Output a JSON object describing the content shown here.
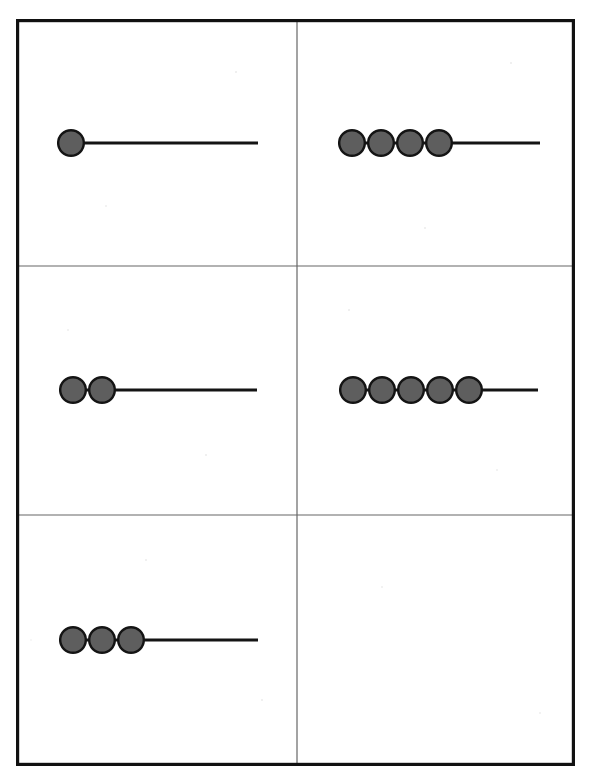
{
  "figure": {
    "background_color": "#ffffff",
    "canvas": {
      "width": 591,
      "height": 781
    }
  },
  "frame": {
    "border_color": "#111111",
    "border_width": 3,
    "divider_color": "#666666",
    "divider_width": 1,
    "x": 16,
    "y": 19,
    "width": 559,
    "height": 747,
    "columns": 2,
    "rows": 3,
    "column_divider_x": [
      281
    ],
    "row_divider_y": [
      247,
      496
    ]
  },
  "style": {
    "circle_fill": "#5e5e5e",
    "circle_stroke": "#141414",
    "circle_stroke_width": 2.4,
    "circle_diameter": 28,
    "circle_pitch": 29,
    "line_color": "#141414",
    "line_width": 3
  },
  "chart_data": {
    "type": "diagram",
    "panel_count": 6,
    "grid": {
      "rows": 3,
      "cols": 2
    },
    "panels": [
      {
        "id": "panel-1",
        "position": "top-left",
        "row": 1,
        "col": 1,
        "circle_count": 1,
        "line_length": 187,
        "has_line": true,
        "label": ""
      },
      {
        "id": "panel-2",
        "position": "top-right",
        "row": 1,
        "col": 2,
        "circle_count": 4,
        "line_length": 86,
        "has_line": true,
        "label": ""
      },
      {
        "id": "panel-3",
        "position": "middle-left",
        "row": 2,
        "col": 1,
        "circle_count": 2,
        "line_length": 158,
        "has_line": true,
        "label": ""
      },
      {
        "id": "panel-4",
        "position": "middle-right",
        "row": 2,
        "col": 2,
        "circle_count": 5,
        "line_length": 56,
        "has_line": true,
        "label": ""
      },
      {
        "id": "panel-5",
        "position": "bottom-left",
        "row": 3,
        "col": 1,
        "circle_count": 3,
        "line_length": 128,
        "has_line": true,
        "label": ""
      },
      {
        "id": "panel-6",
        "position": "bottom-right",
        "row": 3,
        "col": 2,
        "circle_count": 0,
        "line_length": 0,
        "has_line": false,
        "label": ""
      }
    ],
    "xlabel": "",
    "ylabel": "",
    "legend": []
  },
  "geometry": {
    "panels": [
      {
        "id": "panel-1",
        "origin_x": 41,
        "baseline_y": 124,
        "circles": 1,
        "line_end_x": 242
      },
      {
        "id": "panel-2",
        "origin_x": 322,
        "baseline_y": 124,
        "circles": 4,
        "line_end_x": 524
      },
      {
        "id": "panel-3",
        "origin_x": 43,
        "baseline_y": 371,
        "circles": 2,
        "line_end_x": 241
      },
      {
        "id": "panel-4",
        "origin_x": 323,
        "baseline_y": 371,
        "circles": 5,
        "line_end_x": 522
      },
      {
        "id": "panel-5",
        "origin_x": 43,
        "baseline_y": 621,
        "circles": 3,
        "line_end_x": 242
      },
      {
        "id": "panel-6",
        "origin_x": 0,
        "baseline_y": 0,
        "circles": 0,
        "line_end_x": 0
      }
    ]
  }
}
